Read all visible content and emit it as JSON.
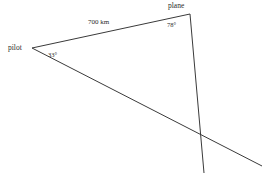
{
  "canvas": {
    "width": 263,
    "height": 176,
    "background_color": "#ffffff",
    "line_color": "#3a3a3a",
    "text_color": "#2b2b2b"
  },
  "diagram": {
    "type": "triangle-bearing-diagram",
    "vertices": {
      "pilot": {
        "label": "pilot",
        "x": 32,
        "y": 48
      },
      "plane": {
        "label": "plane",
        "x": 190,
        "y": 14
      }
    },
    "labels": {
      "pilot": "pilot",
      "plane": "plane",
      "angle_at_pilot": "33°",
      "angle_at_plane": "78°",
      "side_pilot_to_plane": "700 km"
    },
    "angles": {
      "pilot_degrees": 33,
      "plane_degrees": 78
    },
    "measurements": {
      "side_pilot_plane_value": 700,
      "side_pilot_plane_unit": "km"
    },
    "segments": [
      {
        "name": "segment-pilot-to-plane",
        "from_x": 32,
        "from_y": 48,
        "to_x": 190,
        "to_y": 14
      },
      {
        "name": "segment-plane-downward",
        "from_x": 190,
        "from_y": 14,
        "to_x": 204,
        "to_y": 173
      },
      {
        "name": "segment-pilot-downward-right",
        "from_x": 32,
        "from_y": 48,
        "to_x": 262,
        "to_y": 166
      }
    ]
  }
}
